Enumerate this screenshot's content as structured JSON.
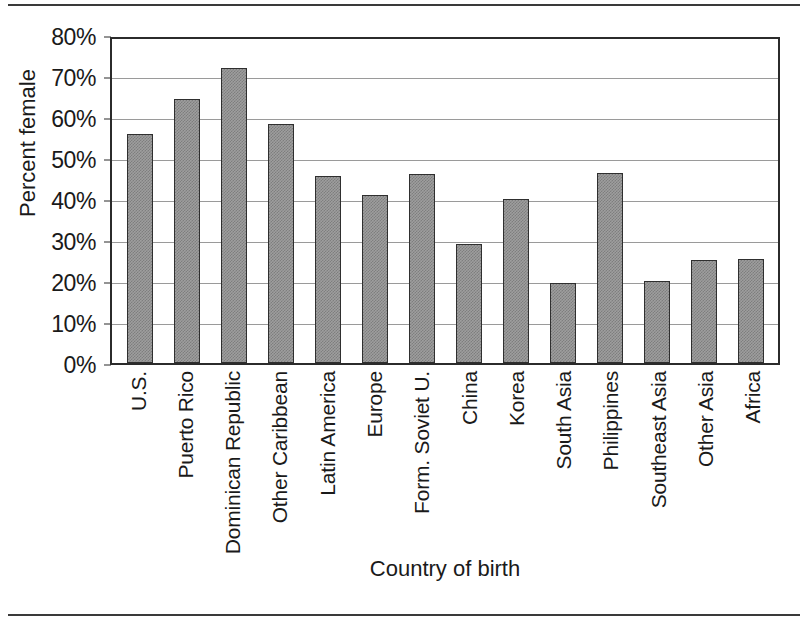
{
  "chart_data": {
    "type": "bar",
    "title": "",
    "xlabel": "Country of birth",
    "ylabel": "Percent female",
    "ylim": [
      0,
      80
    ],
    "ytick_labels": [
      "80%",
      "70%",
      "60%",
      "50%",
      "40%",
      "30%",
      "20%",
      "10%",
      "0%"
    ],
    "ytick_values": [
      80,
      70,
      60,
      50,
      40,
      30,
      20,
      10,
      0
    ],
    "grid": true,
    "legend": "none",
    "value_suffix": "%",
    "categories": [
      "U.S.",
      "Puerto Rico",
      "Dominican Republic",
      "Other Caribbean",
      "Latin America",
      "Europe",
      "Form. Soviet U.",
      "China",
      "Korea",
      "South Asia",
      "Philippines",
      "Southeast Asia",
      "Other Asia",
      "Africa"
    ],
    "values": [
      55.8,
      64.5,
      72.0,
      58.2,
      45.7,
      41.0,
      46.1,
      29.0,
      40.0,
      19.6,
      46.4,
      20.0,
      25.2,
      25.4
    ],
    "bar_fill_color": "#9e9e9e",
    "bar_edge_color": "#2f2f2f"
  }
}
